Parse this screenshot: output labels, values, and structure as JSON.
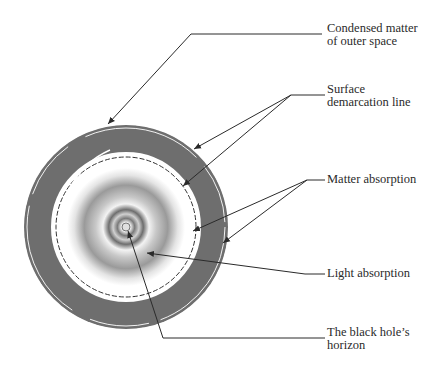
{
  "figure": {
    "type": "black-hole structure cross-section diagram",
    "colors": {
      "background": "#ffffff",
      "outer_band": "#6e6e6e",
      "leader_lines": "#2a2a2a",
      "label_text": "#2a2a2a",
      "core_gradient_dark": "#8a8a8a",
      "core_gradient_light": "#f2f2f2"
    }
  },
  "labels": [
    {
      "id": "condensed",
      "text": "Condensed matter\nof outer space"
    },
    {
      "id": "surface",
      "text": "Surface\ndemarcation line"
    },
    {
      "id": "matter",
      "text": "Matter absorption"
    },
    {
      "id": "light",
      "text": "Light absorption"
    },
    {
      "id": "horizon",
      "text": "The black hole’s\nhorizon"
    }
  ]
}
